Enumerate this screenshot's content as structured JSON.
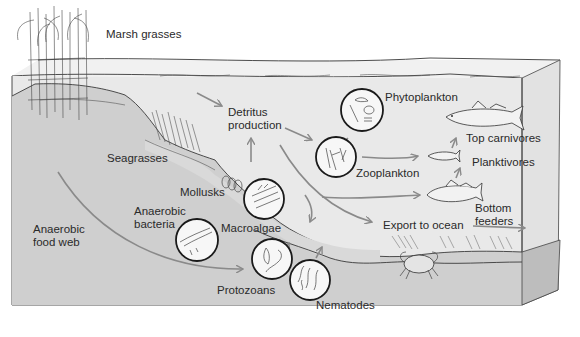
{
  "colors": {
    "water": "#e8e8e8",
    "water_top": "#f0f0f0",
    "sediment": "#c9c9c9",
    "sediment_side": "#b8b8b8",
    "slope": "#d6d6d6",
    "arrow": "#8a8a8a",
    "outline": "#333333"
  },
  "labels": {
    "marsh_grasses": "Marsh grasses",
    "seagrasses": "Seagrasses",
    "detritus_line1": "Detritus",
    "detritus_line2": "production",
    "phytoplankton": "Phytoplankton",
    "zooplankton": "Zooplankton",
    "top_carnivores": "Top carnivores",
    "planktivores": "Planktivores",
    "bottom_feeders_line1": "Bottom",
    "bottom_feeders_line2": "feeders",
    "export_to_ocean": "Export to ocean",
    "mollusks": "Mollusks",
    "macroalgae": "Macroalgae",
    "anaerobic_bacteria_line1": "Anaerobic",
    "anaerobic_bacteria_line2": "bacteria",
    "anaerobic_food_web_line1": "Anaerobic",
    "anaerobic_food_web_line2": "food web",
    "protozoans": "Protozoans",
    "nematodes": "Nematodes"
  },
  "icons": {
    "marsh": "marsh-grass-icon",
    "seagrass": "seagrass-icon",
    "phytoplankton": "phytoplankton-circle-icon",
    "zooplankton": "zooplankton-circle-icon",
    "macroalgae": "macroalgae-circle-icon",
    "bacteria": "bacteria-circle-icon",
    "protozoans": "protozoa-circle-icon",
    "nematodes": "nematode-circle-icon",
    "mollusks": "mollusk-shell-icon",
    "top_fish": "top-carnivore-fish-icon",
    "small_fish": "planktivore-fish-icon",
    "bottom_fish": "bottom-feeder-fish-icon",
    "crab": "crab-icon"
  },
  "flows": [
    {
      "from": "Marsh grasses",
      "to": "Detritus production"
    },
    {
      "from": "Macroalgae",
      "to": "Detritus production"
    },
    {
      "from": "Detritus production",
      "to": "Zooplankton"
    },
    {
      "from": "Phytoplankton",
      "to": "Zooplankton"
    },
    {
      "from": "Zooplankton",
      "to": "Planktivores"
    },
    {
      "from": "Planktivores",
      "to": "Top carnivores"
    },
    {
      "from": "Bottom feeders",
      "to": "Planktivores"
    },
    {
      "from": "Detritus production",
      "to": "Export to ocean"
    },
    {
      "from": "Anaerobic food web",
      "to": "Protozoans"
    },
    {
      "from": "Protozoans",
      "to": "Macroalgae"
    },
    {
      "from": "Nematodes",
      "to": "Macroalgae"
    },
    {
      "from": "Bottom feeders",
      "to": "Ocean"
    }
  ]
}
